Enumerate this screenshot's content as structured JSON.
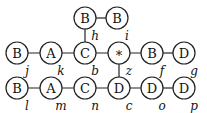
{
  "diagram": {
    "nodes": [
      {
        "id": "h",
        "label": "B",
        "sub": "h",
        "x": 85,
        "y": 18
      },
      {
        "id": "i",
        "label": "B",
        "sub": "i",
        "x": 117,
        "y": 18
      },
      {
        "id": "j",
        "label": "B",
        "sub": "j",
        "x": 17,
        "y": 53
      },
      {
        "id": "k",
        "label": "A",
        "sub": "k",
        "x": 51,
        "y": 53
      },
      {
        "id": "b",
        "label": "C",
        "sub": "b",
        "x": 85,
        "y": 53
      },
      {
        "id": "z",
        "label": "*",
        "sub": "z",
        "x": 119,
        "y": 53
      },
      {
        "id": "f",
        "label": "B",
        "sub": "f",
        "x": 152,
        "y": 53
      },
      {
        "id": "g",
        "label": "D",
        "sub": "g",
        "x": 184,
        "y": 53
      },
      {
        "id": "l",
        "label": "B",
        "sub": "l",
        "x": 17,
        "y": 88
      },
      {
        "id": "m",
        "label": "A",
        "sub": "m",
        "x": 51,
        "y": 88
      },
      {
        "id": "n",
        "label": "C",
        "sub": "n",
        "x": 85,
        "y": 88
      },
      {
        "id": "c",
        "label": "D",
        "sub": "c",
        "x": 119,
        "y": 88
      },
      {
        "id": "o",
        "label": "D",
        "sub": "o",
        "x": 152,
        "y": 88
      },
      {
        "id": "p",
        "label": "D",
        "sub": "p",
        "x": 184,
        "y": 88
      }
    ],
    "edges": [
      [
        "h",
        "i"
      ],
      [
        "h",
        "b"
      ],
      [
        "j",
        "k"
      ],
      [
        "k",
        "b"
      ],
      [
        "b",
        "z"
      ],
      [
        "z",
        "f"
      ],
      [
        "f",
        "g"
      ],
      [
        "z",
        "c"
      ],
      [
        "l",
        "m"
      ],
      [
        "m",
        "n"
      ],
      [
        "n",
        "c"
      ],
      [
        "c",
        "o"
      ],
      [
        "o",
        "p"
      ]
    ]
  }
}
